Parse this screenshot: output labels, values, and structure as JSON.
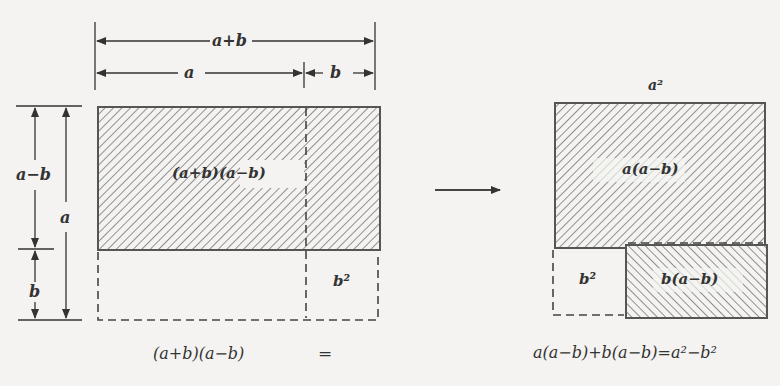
{
  "diagram": {
    "colors": {
      "line": "#555555",
      "hatch": "#7a7a7a",
      "background": "#f4f3f1"
    },
    "top_dimensions": {
      "total": "a+b",
      "part_a": "a",
      "part_b": "b"
    },
    "side_dimensions": {
      "upper": "a−b",
      "lower": "b",
      "total": "a"
    },
    "left_figure": {
      "region_label": "(a+b)(a−b)",
      "corner_label": "b²"
    },
    "arrow": "right-arrow",
    "right_figure": {
      "top_label": "a²",
      "upper_label": "a(a−b)",
      "lower_right_label": "b(a−b)",
      "lower_left_label": "b²"
    },
    "equation": {
      "left": "(a+b)(a−b)",
      "equals": "=",
      "right": "a(a−b)+b(a−b)=a²−b²"
    }
  }
}
